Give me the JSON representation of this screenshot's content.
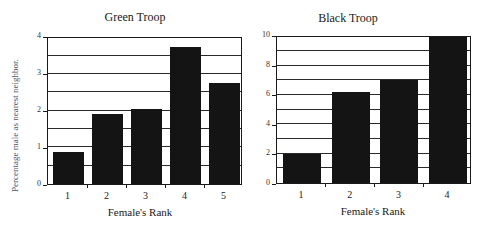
{
  "chart_data": [
    {
      "type": "bar",
      "title": "Green Troop",
      "xlabel": "Female's Rank",
      "ylabel": "Percentage male as nearest neighbor.",
      "categories": [
        "1",
        "2",
        "3",
        "4",
        "5"
      ],
      "values": [
        0.87,
        1.9,
        2.05,
        3.75,
        2.75
      ],
      "ylim": [
        0,
        4
      ],
      "yticks": [
        "0",
        "1",
        "2",
        "3",
        "4"
      ],
      "grid_step": 0.5,
      "grid": true,
      "bar_color": "#141414"
    },
    {
      "type": "bar",
      "title": "Black Troop",
      "xlabel": "Female's Rank",
      "ylabel": "",
      "categories": [
        "1",
        "2",
        "3",
        "4"
      ],
      "values": [
        2.0,
        6.2,
        7.0,
        10.0
      ],
      "ylim": [
        0,
        10
      ],
      "yticks": [
        "0",
        "2",
        "4",
        "6",
        "8",
        "10"
      ],
      "grid_step": 1,
      "grid": true,
      "bar_color": "#141414"
    }
  ]
}
